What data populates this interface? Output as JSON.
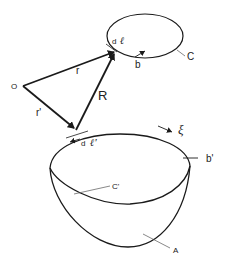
{
  "figure": {
    "type": "physics-diagram",
    "labels": {
      "origin": "O",
      "r": "r",
      "r_prime": "r'",
      "R": "R",
      "dl": "d",
      "dl_ell": "ℓ",
      "dl_prime": "d",
      "dl_prime_ell": "ℓ'",
      "b": "b",
      "b_prime": "b'",
      "C": "C",
      "C_prime": "C'",
      "A": "A",
      "xi": "ξ"
    },
    "colors": {
      "line": "#1a1a1a",
      "background": "#ffffff"
    }
  }
}
